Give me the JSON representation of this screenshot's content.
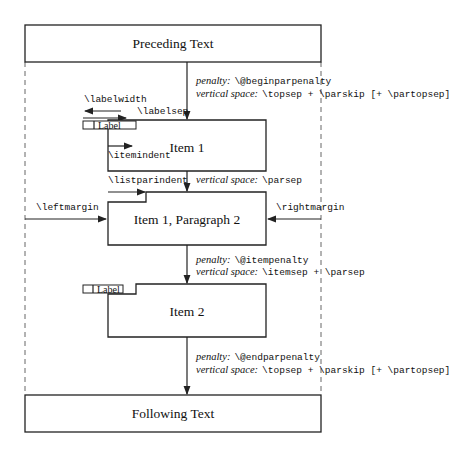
{
  "boxes": {
    "preceding": "Preceding Text",
    "item1": "Item 1",
    "item1p2": "Item 1, Paragraph 2",
    "item2": "Item 2",
    "following": "Following Text"
  },
  "labels": {
    "label_box": "Label",
    "labelwidth": "\\labelwidth",
    "labelsep": "\\labelsep",
    "itemindent": "\\itemindent",
    "listparindent": "\\listparindent",
    "leftmargin": "\\leftmargin",
    "rightmargin": "\\rightmargin"
  },
  "annotations": {
    "begin": {
      "penalty_key": "penalty:",
      "penalty_val": "\\@beginparpenalty",
      "space_key": "vertical space:",
      "space_val": "\\topsep + \\parskip [+ \\partopsep]"
    },
    "parsep": {
      "space_key": "vertical space:",
      "space_val": "\\parsep"
    },
    "item": {
      "penalty_key": "penalty:",
      "penalty_val": "\\@itempenalty",
      "space_key": "vertical space:",
      "space_val": "\\itemsep + \\parsep"
    },
    "end": {
      "penalty_key": "penalty:",
      "penalty_val": "\\@endparpenalty",
      "space_key": "vertical space:",
      "space_val": "\\topsep + \\parskip [+ \\partopsep]"
    }
  }
}
